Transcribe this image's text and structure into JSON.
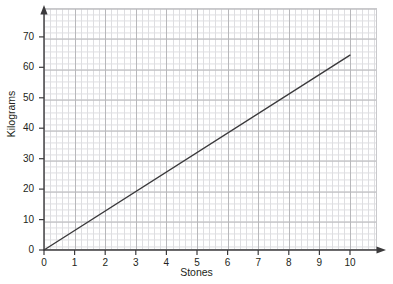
{
  "chart_data": {
    "type": "line",
    "title": "",
    "subtitle": "",
    "xlabel": "Stones",
    "ylabel": "Kilograms",
    "xlim": [
      0,
      10.9
    ],
    "ylim": [
      0,
      79
    ],
    "xticks": [
      0,
      1,
      2,
      3,
      4,
      5,
      6,
      7,
      8,
      9,
      10
    ],
    "xtick_labels": [
      "0",
      "1",
      "2",
      "3",
      "4",
      "5",
      "6",
      "7",
      "8",
      "9",
      "10"
    ],
    "yticks": [
      0,
      10,
      20,
      30,
      40,
      50,
      60,
      70
    ],
    "ytick_labels": [
      "0",
      "10",
      "20",
      "30",
      "40",
      "50",
      "60",
      "70"
    ],
    "grid": true,
    "grid_minor": true,
    "legend": null,
    "legend_position": "none",
    "series": [
      {
        "name": "Stones to kilograms conversion",
        "x": [
          0,
          10
        ],
        "values": [
          0,
          64
        ],
        "color": "#3b3a3c",
        "line_width": 1.4,
        "markers": false
      }
    ],
    "annotations": []
  },
  "axes": {
    "x_axis_name": "x-axis",
    "y_axis_name": "y-axis",
    "arrowheads": true
  },
  "colors": {
    "line": "#3b3a3c",
    "axis": "#3b3a3c",
    "grid_major": "#b8b8bb",
    "grid_minor": "#dedee1",
    "text": "#231f20",
    "background": "#ffffff"
  }
}
